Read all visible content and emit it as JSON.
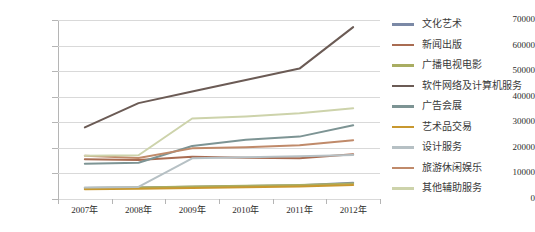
{
  "chart_data": {
    "type": "line",
    "title": "",
    "xlabel": "",
    "ylabel": "",
    "categories": [
      "2007年",
      "2008年",
      "2009年",
      "2010年",
      "2011年",
      "2012年"
    ],
    "ylim": [
      0,
      70000
    ],
    "ytick_labels": [
      "0",
      "10000",
      "20000",
      "30000",
      "40000",
      "50000",
      "60000",
      "70000"
    ],
    "ytick_values": [
      0,
      10000,
      20000,
      30000,
      40000,
      50000,
      60000,
      70000
    ],
    "grid": true,
    "legend_position": "right",
    "series": [
      {
        "name": "文化艺术",
        "color": "#7b89a6",
        "values": [
          4300,
          4500,
          4800,
          5100,
          5400,
          6400
        ]
      },
      {
        "name": "新闻出版",
        "color": "#a96c52",
        "values": [
          15500,
          15300,
          16500,
          16100,
          15900,
          17500
        ]
      },
      {
        "name": "广播电视电影",
        "color": "#a9ad62",
        "values": [
          4300,
          4500,
          4900,
          5200,
          5500,
          6100
        ]
      },
      {
        "name": "软件网络及计算机服务",
        "color": "#6b5b55",
        "values": [
          28000,
          37500,
          42000,
          46500,
          51000,
          67200
        ]
      },
      {
        "name": "广告会展",
        "color": "#7d9494",
        "values": [
          13800,
          14200,
          20700,
          23200,
          24400,
          28800
        ]
      },
      {
        "name": "艺术品交易",
        "color": "#c8982f",
        "values": [
          3800,
          4000,
          4300,
          4600,
          4900,
          5500
        ]
      },
      {
        "name": "设计服务",
        "color": "#b6c0c4",
        "values": [
          4500,
          4700,
          15900,
          16300,
          16700,
          17200
        ]
      },
      {
        "name": "旅游休闲娱乐",
        "color": "#c08a6a",
        "values": [
          16900,
          16000,
          19800,
          20200,
          21000,
          23000
        ]
      },
      {
        "name": "其他辅助服务",
        "color": "#cdd3ab",
        "values": [
          16900,
          17100,
          31500,
          32300,
          33500,
          35500
        ]
      }
    ]
  }
}
